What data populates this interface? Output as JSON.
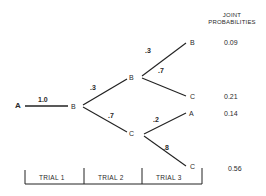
{
  "header": {
    "line1": "JOINT",
    "line2": "PROBABILITIES"
  },
  "tree": {
    "root": "A",
    "root_edge_prob": "1.0",
    "trial1_node": "B",
    "level2": [
      {
        "node": "B",
        "prob": ".3"
      },
      {
        "node": "C",
        "prob": ".7"
      }
    ],
    "level3": [
      {
        "parent": "B",
        "node": "B",
        "prob": ".3",
        "joint": "0.09"
      },
      {
        "parent": "B",
        "node": "C",
        "prob": ".7",
        "joint": "0.21"
      },
      {
        "parent": "C",
        "node": "A",
        "prob": ".2",
        "joint": "0.14"
      },
      {
        "parent": "C",
        "node": "C",
        "prob": ".8",
        "joint": "0.56"
      }
    ]
  },
  "trials": [
    {
      "label": "TRIAL 1"
    },
    {
      "label": "TRIAL 2"
    },
    {
      "label": "TRIAL 3"
    }
  ],
  "colors": {
    "ink": "#222222",
    "background": "#ffffff"
  }
}
